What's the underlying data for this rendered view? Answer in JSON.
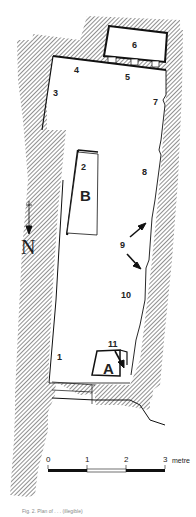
{
  "diagram": {
    "type": "archaeological site plan",
    "hatch_color": "#333333",
    "line_color": "#111111",
    "labels": {
      "n1": "1",
      "n2": "2",
      "n3": "3",
      "n4": "4",
      "n5": "5",
      "n6": "6",
      "n7": "7",
      "n8": "8",
      "n9": "9",
      "n10": "10",
      "n11": "11",
      "A": "A",
      "B": "B"
    },
    "north_arrow": {
      "label": "N",
      "icon": "north-arrow-icon"
    },
    "scale_bar": {
      "ticks": [
        "0",
        "1",
        "2",
        "3"
      ],
      "unit": "metre"
    },
    "caption": "Fig. 2. Plan of . . . (illegible)"
  }
}
